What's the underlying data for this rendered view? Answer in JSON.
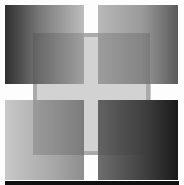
{
  "artwork": {
    "description": "Four grayscale gradient squares separated by a white cross, with a translucent gray square overlapping the center",
    "colors": {
      "background": "#ffffff",
      "top_left_gradient": [
        "#2e2e2e",
        "#7a7a7a",
        "#bdbdbd"
      ],
      "top_right_gradient": [
        "#b8b8b8",
        "#9a9a9a",
        "#5a5a5a"
      ],
      "bottom_left_gradient": [
        "#c8c8c8",
        "#a8a8a8",
        "#8e8e8e"
      ],
      "bottom_right_gradient": [
        "#6e6e6e",
        "#3e3e3e",
        "#1a1a1a"
      ],
      "overlay": "rgba(60,60,60,0.22)",
      "bottom_strip": "#111111"
    }
  }
}
